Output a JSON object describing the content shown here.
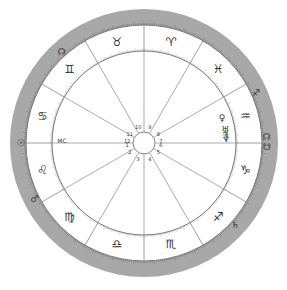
{
  "chart": {
    "type": "natal-wheel",
    "center": [
      144,
      143
    ],
    "radii": {
      "outer": 134,
      "band_inner": 118,
      "zodiac_inner": 92,
      "hub": 11
    },
    "colors": {
      "band": "#a8a8a8",
      "lines": "#888888",
      "ring": "#7a7a7a",
      "glyph": "#333333",
      "background": "#ffffff"
    }
  },
  "signs": [
    {
      "name": "Aries",
      "glyph": "♈",
      "angle": 75
    },
    {
      "name": "Taurus",
      "glyph": "♉",
      "angle": 105
    },
    {
      "name": "Gemini",
      "glyph": "♊",
      "angle": 135
    },
    {
      "name": "Cancer",
      "glyph": "♋",
      "angle": 165
    },
    {
      "name": "Leo",
      "glyph": "♌",
      "angle": 195
    },
    {
      "name": "Virgo",
      "glyph": "♍",
      "angle": 225
    },
    {
      "name": "Libra",
      "glyph": "♎",
      "angle": 255
    },
    {
      "name": "Scorpio",
      "glyph": "♏",
      "angle": 285
    },
    {
      "name": "Sagittarius",
      "glyph": "♐",
      "angle": 315
    },
    {
      "name": "Capricorn",
      "glyph": "♑",
      "angle": 345
    },
    {
      "name": "Aquarius",
      "glyph": "♒",
      "angle": 15
    },
    {
      "name": "Pisces",
      "glyph": "♓",
      "angle": 45
    }
  ],
  "houses": [
    {
      "num": "1",
      "angle": 187
    },
    {
      "num": "2",
      "angle": 213
    },
    {
      "num": "3",
      "angle": 250
    },
    {
      "num": "4",
      "angle": 290
    },
    {
      "num": "5",
      "angle": 327
    },
    {
      "num": "6",
      "angle": 353
    },
    {
      "num": "7",
      "angle": 7
    },
    {
      "num": "8",
      "angle": 33
    },
    {
      "num": "9",
      "angle": 70
    },
    {
      "num": "10",
      "angle": 110
    },
    {
      "num": "11",
      "angle": 147
    },
    {
      "num": "12",
      "angle": 173
    }
  ],
  "outer_planets": [
    {
      "name": "Sun",
      "glyph": "☉",
      "angle": 180
    },
    {
      "name": "Mars",
      "glyph": "♂",
      "angle": 207
    },
    {
      "name": "Moon-node",
      "glyph": "☊",
      "angle": 132
    },
    {
      "name": "Sagittarius-marker",
      "glyph": "♐",
      "angle": 24
    },
    {
      "name": "North-node",
      "glyph": "☊",
      "angle": 3
    },
    {
      "name": "South-node",
      "glyph": "☋",
      "angle": 358
    },
    {
      "name": "Saturn",
      "glyph": "♄",
      "angle": 318
    }
  ],
  "inner_planets": [
    {
      "name": "Venus",
      "glyph": "♀",
      "angle": 18,
      "label": ""
    },
    {
      "name": "Uranus",
      "glyph": "♅",
      "angle": 9,
      "label": ""
    },
    {
      "name": "Jupiter",
      "glyph": "♃",
      "angle": 6,
      "label": ""
    },
    {
      "name": "Neptune",
      "glyph": "♆",
      "angle": 3,
      "label": ""
    },
    {
      "name": "MC",
      "glyph": "MC",
      "angle": 178,
      "label": ""
    }
  ]
}
